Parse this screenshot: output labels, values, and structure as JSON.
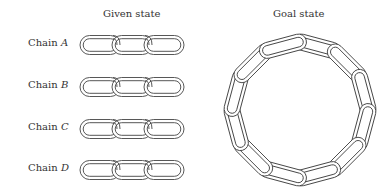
{
  "headers": {
    "given": "Given state",
    "goal": "Goal state"
  },
  "chains": [
    {
      "prefix": "Chain ",
      "letter": "A",
      "links": 3
    },
    {
      "prefix": "Chain ",
      "letter": "B",
      "links": 3
    },
    {
      "prefix": "Chain ",
      "letter": "C",
      "links": 3
    },
    {
      "prefix": "Chain ",
      "letter": "D",
      "links": 3
    }
  ],
  "goal_ring": {
    "links": 12
  },
  "colors": {
    "stroke": "#444444",
    "text": "#333333"
  }
}
